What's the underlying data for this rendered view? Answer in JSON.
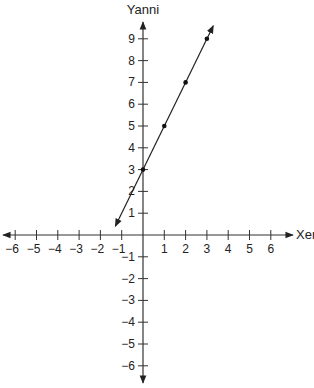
{
  "chart_data": {
    "type": "line",
    "title": "",
    "xlabel": "Xenia",
    "ylabel": "Yanni",
    "xlim": [
      -6,
      6
    ],
    "ylim": [
      -6,
      9
    ],
    "x_ticks": [
      -6,
      -5,
      -4,
      -3,
      -2,
      -1,
      1,
      2,
      3,
      4,
      5,
      6
    ],
    "y_ticks": [
      -6,
      -5,
      -4,
      -3,
      -2,
      -1,
      1,
      2,
      3,
      4,
      5,
      6,
      7,
      8,
      9
    ],
    "grid": false,
    "series": [
      {
        "name": "line",
        "x": [
          0,
          1,
          2,
          3
        ],
        "y": [
          3,
          5,
          7,
          9
        ],
        "equation": "y = 2x + 3",
        "arrows_both_ends": true
      }
    ]
  },
  "labels": {
    "x_axis": "Xenia",
    "y_axis": "Yanni"
  }
}
